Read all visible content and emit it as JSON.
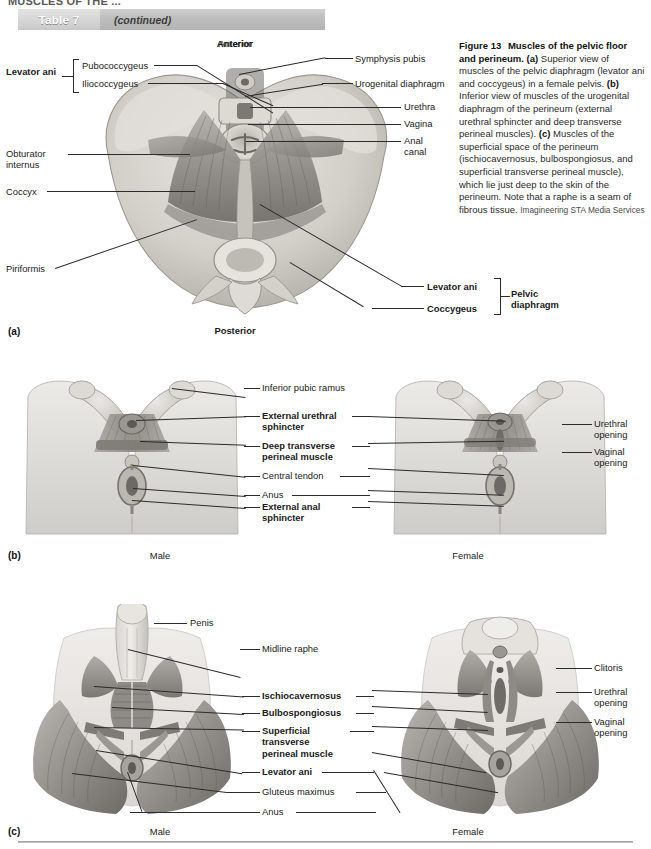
{
  "page": {
    "cut_off_header": "MUSCLES OF THE ...",
    "bottom_rule": true
  },
  "table_banner": {
    "tab_label": "Table 7",
    "continued_label": "(continued)"
  },
  "caption": {
    "figure_number": "Figure 13",
    "title": "Muscles of the pelvic floor and perineum.",
    "part_a_marker": "(a)",
    "part_a_text": " Superior view of muscles of the pelvic diaphragm (levator ani and coccygeus) in a female pelvis. ",
    "part_b_marker": "(b)",
    "part_b_text": " Inferior view of muscles of the urogenital diaphragm of the perineum (external urethral sphincter and deep transverse perineal muscles). ",
    "part_c_marker": "(c)",
    "part_c_text": " Muscles of the superficial space of the perineum (ischiocavernosus, bulbospongiosus, and superficial transverse perineal muscle), which lie just deep to the skin of the perineum. Note that a raphe is a seam of fibrous tissue. ",
    "credit": "Imagineering STA Media Services"
  },
  "panel_a": {
    "letter": "(a)",
    "orientation_top": "Anterior",
    "orientation_bottom": "Posterior",
    "group_label": "Levator ani",
    "group_items": [
      "Pubococcygeus",
      "Iliococcygeus"
    ],
    "left_labels": [
      "Obturator\ninternus",
      "Coccyx",
      "Piriformis"
    ],
    "right_labels": [
      "Symphysis pubis",
      "Urogenital diaphragm",
      "Urethra",
      "Vagina",
      "Anal\ncanal"
    ],
    "bracket_group_label": "Pelvic\ndiaphragm",
    "bracket_group_items": [
      "Levator ani",
      "Coccygeus"
    ]
  },
  "panel_b": {
    "letter": "(b)",
    "male_label": "Male",
    "female_label": "Female",
    "center_labels": [
      {
        "text": "Inferior pubic ramus",
        "bold": false
      },
      {
        "text": "External urethral\nsphincter",
        "bold": true
      },
      {
        "text": "Deep transverse\nperineal muscle",
        "bold": true
      },
      {
        "text": "Central tendon",
        "bold": false
      },
      {
        "text": "Anus",
        "bold": false
      },
      {
        "text": "External anal\nsphincter",
        "bold": true
      }
    ],
    "right_labels": [
      {
        "text": "Urethral\nopening",
        "bold": false
      },
      {
        "text": "Vaginal\nopening",
        "bold": false
      }
    ]
  },
  "panel_c": {
    "letter": "(c)",
    "male_label": "Male",
    "female_label": "Female",
    "penis_label": "Penis",
    "center_labels": [
      {
        "text": "Midline raphe",
        "bold": false
      },
      {
        "text": "Ischiocavernosus",
        "bold": true
      },
      {
        "text": "Bulbospongiosus",
        "bold": true
      },
      {
        "text": "Superficial\ntransverse\nperineal muscle",
        "bold": true
      },
      {
        "text": "Levator ani",
        "bold": true
      },
      {
        "text": "Gluteus maximus",
        "bold": false
      },
      {
        "text": "Anus",
        "bold": false
      }
    ],
    "right_labels": [
      {
        "text": "Clitoris",
        "bold": false
      },
      {
        "text": "Urethral\nopening",
        "bold": false
      },
      {
        "text": "Vaginal\nopening",
        "bold": false
      }
    ]
  },
  "colors": {
    "banner_gray": "#bdbdbd",
    "tab_gray": "#d4d4d4",
    "leader_line": "#2b2b2b",
    "text": "#1a1a1a",
    "muscle_gray": "#8e8e8e",
    "bone_light": "#d8d6d2",
    "skin_light": "#dcdad6"
  }
}
